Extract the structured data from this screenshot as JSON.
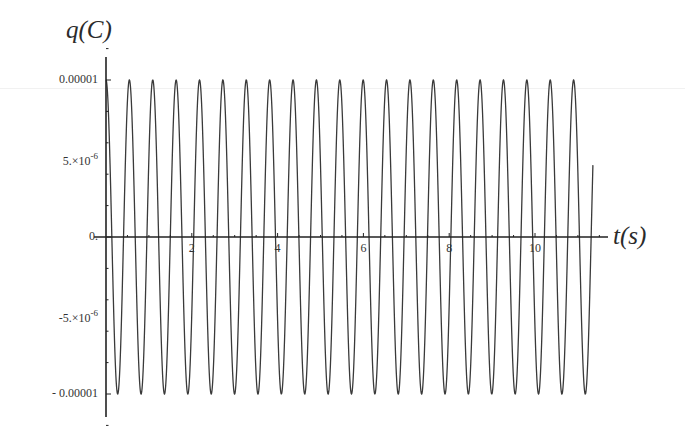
{
  "chart_data": {
    "type": "line",
    "title": "",
    "ylabel": "q(C)",
    "xlabel": "t(s)",
    "function": "q(t) = 0.00001 * cos(2*pi*t/0.545)",
    "amplitude": 1e-05,
    "period_s": 0.545,
    "x_range": [
      0,
      11.35
    ],
    "xlim": [
      -0.27,
      11.75
    ],
    "ylim": [
      -1.15e-05,
      1.15e-05
    ],
    "x_ticks": [
      2,
      4,
      6,
      8,
      10
    ],
    "x_tick_labels": [
      "2",
      "4",
      "6",
      "8",
      "10"
    ],
    "y_ticks": [
      1e-05,
      5e-06,
      0,
      -5e-06,
      -1e-05
    ],
    "y_tick_labels": [
      {
        "base": "0.00001",
        "exp": ""
      },
      {
        "base": "5.×10",
        "exp": "-6"
      },
      {
        "base": "0.",
        "exp": ""
      },
      {
        "base": "-5.×10",
        "exp": "-6"
      },
      {
        "base": "- 0.00001",
        "exp": ""
      }
    ],
    "grid": false,
    "legend": null,
    "series": [
      {
        "name": "q(t)",
        "color": "#3a3a3a",
        "note": "undamped oscillation, ~21 cycles, starts at maximum"
      }
    ]
  },
  "labels": {
    "y_axis_title": "q(C)",
    "x_axis_title": "t(s)"
  },
  "colors": {
    "line": "#3a3a3a",
    "axis": "#222222",
    "background": "#ffffff"
  }
}
